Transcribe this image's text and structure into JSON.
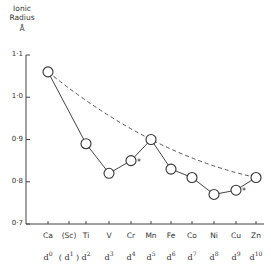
{
  "chart_data": {
    "type": "line",
    "title": "",
    "ylabel": "Ionic Radius",
    "ylabel_unit": "Å",
    "xlabel": "",
    "ylim": [
      0.7,
      1.1
    ],
    "yticks": [
      "1·1",
      "1·0",
      "0·9",
      "0·8",
      "0·7"
    ],
    "categories": [
      "Ca",
      "(Sc)",
      "Ti",
      "V",
      "Cr",
      "Mn",
      "Fe",
      "Co",
      "Ni",
      "Cu",
      "Zn"
    ],
    "d_configs": [
      "d0",
      "(d1)",
      "d2",
      "d3",
      "d4",
      "d5",
      "d6",
      "d7",
      "d8",
      "d9",
      "d10"
    ],
    "series": [
      {
        "name": "Observed ionic radii (M2+)",
        "style": "solid line with open circles",
        "points": [
          {
            "x": "Ca",
            "y": 1.06
          },
          {
            "x": "Ti",
            "y": 0.89
          },
          {
            "x": "V",
            "y": 0.82
          },
          {
            "x": "Cr",
            "y": 0.85,
            "annotation": "*"
          },
          {
            "x": "Mn",
            "y": 0.9
          },
          {
            "x": "Fe",
            "y": 0.83
          },
          {
            "x": "Co",
            "y": 0.81
          },
          {
            "x": "Ni",
            "y": 0.77
          },
          {
            "x": "Cu",
            "y": 0.78,
            "annotation": "*"
          },
          {
            "x": "Zn",
            "y": 0.81
          }
        ]
      },
      {
        "name": "Spherical-ion trend",
        "style": "dashed curve",
        "points": [
          {
            "x": "Ca",
            "y": 1.06
          },
          {
            "x": "Mn",
            "y": 0.9
          },
          {
            "x": "Zn",
            "y": 0.81
          }
        ]
      }
    ],
    "grid": false,
    "legend": "none"
  }
}
